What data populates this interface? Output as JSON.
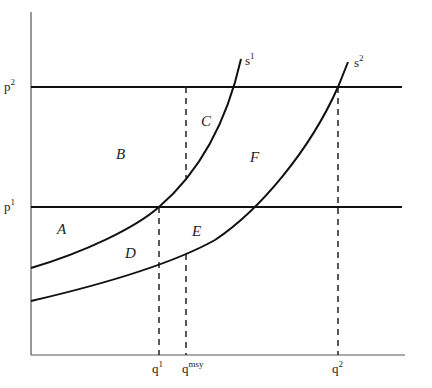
{
  "diagram": {
    "type": "supply-shift-price-quantity",
    "axes": {
      "y_ticks": [
        {
          "base": "p",
          "sup": "2",
          "y": 87
        },
        {
          "base": "p",
          "sup": "1",
          "y": 207
        }
      ],
      "x_ticks": [
        {
          "base": "q",
          "sup": "1",
          "x": 159
        },
        {
          "base": "q",
          "sup": "msy",
          "x": 186
        },
        {
          "base": "q",
          "sup": "2",
          "x": 338
        }
      ]
    },
    "curves": [
      {
        "base": "s",
        "sup": "1"
      },
      {
        "base": "s",
        "sup": "2"
      }
    ],
    "regions": [
      "A",
      "B",
      "C",
      "D",
      "E",
      "F"
    ],
    "caption": "",
    "colors": {
      "line": "#111111",
      "axis": "#555555",
      "text": "#222222",
      "background": "#ffffff"
    }
  }
}
